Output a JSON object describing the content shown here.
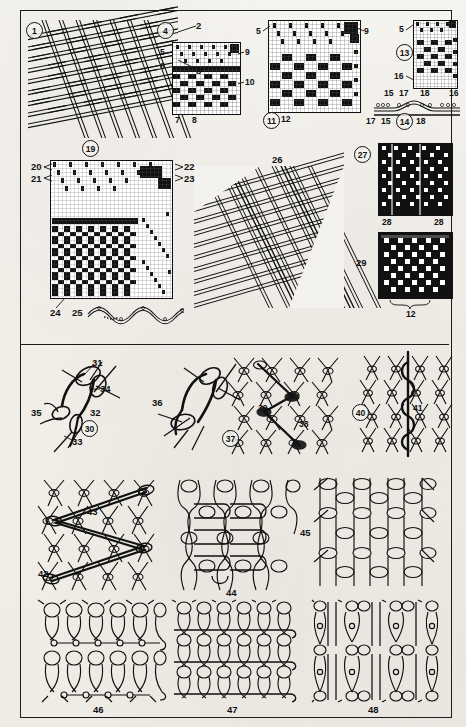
{
  "plate": {
    "title": "Textile structure plate",
    "background_color": "#f4f2ee",
    "ink_color": "#111111",
    "sections": [
      "woven-fabrics-and-weave-drafts",
      "knitted-and-net-loop-structures"
    ]
  },
  "figures": [
    {
      "id": "fig-1",
      "number": "1",
      "circled": true,
      "kind": "woven-fabric-drawing",
      "caption_position": "upper-left"
    },
    {
      "id": "fig-4",
      "number": "4",
      "circled": true,
      "kind": "weave-draft-grid"
    },
    {
      "id": "fig-11",
      "number": "11",
      "circled": true,
      "kind": "weave-draft-grid"
    },
    {
      "id": "fig-13",
      "number": "13",
      "circled": true,
      "kind": "weave-draft-grid"
    },
    {
      "id": "fig-14",
      "number": "14",
      "circled": true,
      "kind": "yarn-cross-section"
    },
    {
      "id": "fig-19",
      "number": "19",
      "circled": true,
      "kind": "weave-draft-grid"
    },
    {
      "id": "fig-26",
      "number": "26",
      "circled": false,
      "kind": "woven-fabric-drawing"
    },
    {
      "id": "fig-27",
      "number": "27",
      "circled": true,
      "kind": "pattern-swatch"
    },
    {
      "id": "fig-29",
      "number": "29",
      "circled": false,
      "kind": "pattern-swatch"
    },
    {
      "id": "fig-30",
      "number": "30",
      "circled": true,
      "kind": "loop-detail"
    },
    {
      "id": "fig-36",
      "number": "36",
      "circled": false,
      "kind": "loop-detail"
    },
    {
      "id": "fig-37",
      "number": "37",
      "circled": true,
      "kind": "net-mesh"
    },
    {
      "id": "fig-40",
      "number": "40",
      "circled": true,
      "kind": "net-mesh"
    },
    {
      "id": "fig-42",
      "number": "42",
      "circled": false,
      "kind": "net-mesh"
    },
    {
      "id": "fig-44",
      "number": "44",
      "circled": false,
      "kind": "warp-knit"
    },
    {
      "id": "fig-45",
      "number": "45",
      "circled": false,
      "kind": "warp-knit"
    },
    {
      "id": "fig-46",
      "number": "46",
      "circled": false,
      "kind": "warp-knit"
    },
    {
      "id": "fig-47",
      "number": "47",
      "circled": false,
      "kind": "warp-knit"
    },
    {
      "id": "fig-48",
      "number": "48",
      "circled": false,
      "kind": "warp-knit"
    }
  ],
  "callouts": {
    "fig1": [
      {
        "n": "2"
      },
      {
        "n": "3"
      }
    ],
    "fig4": [
      {
        "n": "5"
      },
      {
        "n": "6"
      },
      {
        "n": "7"
      },
      {
        "n": "8"
      },
      {
        "n": "9"
      },
      {
        "n": "10"
      }
    ],
    "fig11": [
      {
        "n": "5"
      },
      {
        "n": "9"
      },
      {
        "n": "12"
      }
    ],
    "fig13": [
      {
        "n": "5"
      },
      {
        "n": "16"
      },
      {
        "n": "15"
      },
      {
        "n": "17"
      },
      {
        "n": "18"
      },
      {
        "n": "16b"
      }
    ],
    "fig14": [
      {
        "n": "17"
      },
      {
        "n": "15"
      },
      {
        "n": "18"
      }
    ],
    "fig19": [
      {
        "n": "20"
      },
      {
        "n": "21"
      },
      {
        "n": "22"
      },
      {
        "n": "23"
      },
      {
        "n": "24"
      },
      {
        "n": "25"
      }
    ],
    "fig27": [
      {
        "n": "28"
      },
      {
        "n": "28b"
      }
    ],
    "fig29": [
      {
        "n": "12"
      }
    ],
    "fig30": [
      {
        "n": "31"
      },
      {
        "n": "32"
      },
      {
        "n": "33"
      },
      {
        "n": "34"
      },
      {
        "n": "35"
      }
    ],
    "fig37": [
      {
        "n": "38"
      },
      {
        "n": "39"
      }
    ],
    "fig40": [
      {
        "n": "41"
      }
    ],
    "fig42": [
      {
        "n": "43"
      }
    ]
  },
  "labels": {
    "n1": "1",
    "n2": "2",
    "n3": "3",
    "n4": "4",
    "n5": "5",
    "n6": "6",
    "n7": "7",
    "n8": "8",
    "n9": "9",
    "n10": "10",
    "n11": "11",
    "n12": "12",
    "n13": "13",
    "n14": "14",
    "n15": "15",
    "n16": "16",
    "n17": "17",
    "n18": "18",
    "n19": "19",
    "n20": "20",
    "n21": "21",
    "n22": "22",
    "n23": "23",
    "n24": "24",
    "n25": "25",
    "n26": "26",
    "n27": "27",
    "n28": "28",
    "n29": "29",
    "n30": "30",
    "n31": "31",
    "n32": "32",
    "n33": "33",
    "n34": "34",
    "n35": "35",
    "n36": "36",
    "n37": "37",
    "n38": "38",
    "n39": "39",
    "n40": "40",
    "n41": "41",
    "n42": "42",
    "n43": "43",
    "n44": "44",
    "n45": "45",
    "n46": "46",
    "n47": "47",
    "n48": "48"
  }
}
